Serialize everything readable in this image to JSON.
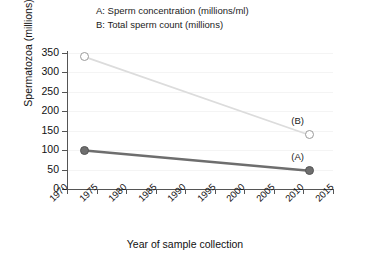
{
  "chart_data": {
    "type": "line",
    "title": "",
    "xlabel": "Year of sample collection",
    "ylabel": "Spermatozoa (millions)",
    "xlim": [
      1970,
      2015
    ],
    "ylim": [
      0,
      350
    ],
    "xticks": [
      1970,
      1975,
      1980,
      1985,
      1990,
      1995,
      2000,
      2005,
      2010,
      2015
    ],
    "yticks": [
      0,
      50,
      100,
      150,
      200,
      250,
      300,
      350
    ],
    "grid": "faint-horizontal",
    "legend_position": "top-center",
    "legend": [
      "A: Sperm concentration (millions/ml)",
      "B: Total sperm count (millions)"
    ],
    "series": [
      {
        "name": "A",
        "label": "A: Sperm concentration (millions/ml)",
        "annotation": "(A)",
        "color": "#6e6e6e",
        "marker": "filled-circle",
        "x": [
          1973,
          2011
        ],
        "values": [
          99,
          47
        ]
      },
      {
        "name": "B",
        "label": "B: Total sperm count (millions)",
        "annotation": "(B)",
        "color": "#dcdcdc",
        "marker": "open-circle",
        "x": [
          1973,
          2011
        ],
        "values": [
          340,
          139
        ]
      }
    ]
  },
  "legend": {
    "row_a": "A: Sperm concentration (millions/ml)",
    "row_b": "B: Total sperm count (millions)"
  },
  "axes": {
    "y_title": "Spermatozoa (millions)",
    "x_title": "Year of sample collection",
    "y_ticks": [
      "350",
      "300",
      "250",
      "200",
      "150",
      "100",
      "50",
      "0"
    ],
    "x_ticks": [
      "1970",
      "1975",
      "1980",
      "1985",
      "1990",
      "1995",
      "2000",
      "2005",
      "2010",
      "2015"
    ]
  },
  "annotations": {
    "series_a": "(A)",
    "series_b": "(B)"
  },
  "colors": {
    "series_a": "#6e6e6e",
    "series_b": "#dcdcdc",
    "axis": "#555555",
    "grid": "#f4f4f4",
    "text": "#111111",
    "background": "#ffffff"
  }
}
